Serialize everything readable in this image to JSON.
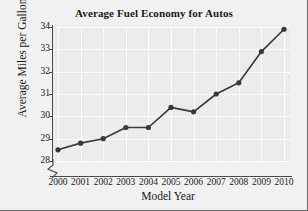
{
  "chart_data": {
    "type": "line",
    "title": "Average Fuel Economy for Autos",
    "xlabel": "Model Year",
    "ylabel": "Average Miles per Gallon",
    "categories": [
      "2000",
      "2001",
      "2002",
      "2003",
      "2004",
      "2005",
      "2006",
      "2007",
      "2008",
      "2009",
      "2010"
    ],
    "x": [
      2000,
      2001,
      2002,
      2003,
      2004,
      2005,
      2006,
      2007,
      2008,
      2009,
      2010
    ],
    "values": [
      28.5,
      28.8,
      29.0,
      29.5,
      29.5,
      30.4,
      30.2,
      31.0,
      31.5,
      32.9,
      33.9
    ],
    "ylim": [
      28,
      34
    ],
    "xlim": [
      2000,
      2010
    ],
    "yticks": [
      28,
      29,
      30,
      31,
      32,
      33,
      34
    ],
    "ytick_labels": [
      "28",
      "29",
      "30",
      "31",
      "32",
      "33",
      "34"
    ],
    "xtick_labels": [
      "2000",
      "2001",
      "2002",
      "2003",
      "2004",
      "2005",
      "2006",
      "2007",
      "2008",
      "2009",
      "2010"
    ],
    "grid": true,
    "legend": null,
    "axis_break": true,
    "marker": "circle",
    "series_color": "#3a3a3a",
    "plot_background": "#ececec",
    "gridline_color": "#fbfbfb",
    "figure_background": "#f1f1f1"
  }
}
